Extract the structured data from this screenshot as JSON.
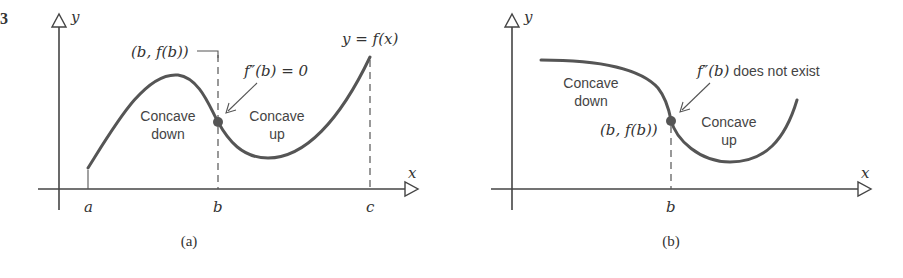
{
  "figure_number_fragment": "3",
  "panels": [
    {
      "id": "a",
      "caption": "(a)",
      "axes": {
        "x_label": "x",
        "y_label": "y"
      },
      "ticks": [
        "a",
        "b",
        "c"
      ],
      "curve_label": "y = f(x)",
      "point_label": "(b, f(b))",
      "annotation": "f″(b) = 0",
      "regions": [
        {
          "line1": "Concave",
          "line2": "down"
        },
        {
          "line1": "Concave",
          "line2": "up"
        }
      ]
    },
    {
      "id": "b",
      "caption": "(b)",
      "axes": {
        "x_label": "x",
        "y_label": "y"
      },
      "ticks": [
        "b"
      ],
      "point_label": "(b, f(b))",
      "annotation_math": "f″(b)",
      "annotation_text": " does not exist",
      "regions": [
        {
          "line1": "Concave",
          "line2": "down"
        },
        {
          "line1": "Concave",
          "line2": "up"
        }
      ]
    }
  ],
  "colors": {
    "curve": "#555555",
    "point": "#555555",
    "axis": "#444444",
    "background": "#ffffff"
  }
}
